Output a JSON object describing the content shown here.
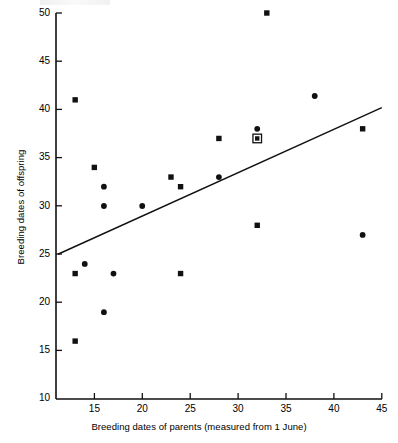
{
  "chart_data": {
    "type": "scatter",
    "title": "",
    "xlabel": "Breeding dates of parents (measured from 1 June)",
    "ylabel": "Breeding dates of offspring",
    "xlim": [
      11,
      45
    ],
    "ylim": [
      10,
      50
    ],
    "xticks": [
      15,
      20,
      25,
      30,
      35,
      40,
      45
    ],
    "yticks": [
      10,
      15,
      20,
      25,
      30,
      35,
      40,
      45,
      50
    ],
    "grid": false,
    "legend": "none",
    "series": [
      {
        "name": "square-markers",
        "marker": "square",
        "points": [
          {
            "x": 13,
            "y": 41
          },
          {
            "x": 13,
            "y": 23
          },
          {
            "x": 13,
            "y": 16
          },
          {
            "x": 15,
            "y": 34
          },
          {
            "x": 23,
            "y": 33
          },
          {
            "x": 24,
            "y": 32
          },
          {
            "x": 24,
            "y": 23
          },
          {
            "x": 28,
            "y": 37
          },
          {
            "x": 32,
            "y": 28
          },
          {
            "x": 33,
            "y": 50
          },
          {
            "x": 43,
            "y": 38
          }
        ]
      },
      {
        "name": "circle-markers",
        "marker": "circle",
        "points": [
          {
            "x": 14,
            "y": 24
          },
          {
            "x": 16,
            "y": 32
          },
          {
            "x": 16,
            "y": 30
          },
          {
            "x": 16,
            "y": 19
          },
          {
            "x": 17,
            "y": 23
          },
          {
            "x": 20,
            "y": 30
          },
          {
            "x": 28,
            "y": 33
          },
          {
            "x": 32,
            "y": 38
          },
          {
            "x": 38,
            "y": 41.4
          },
          {
            "x": 43,
            "y": 27
          }
        ]
      },
      {
        "name": "overlapping-square-circle",
        "marker": "square-with-circle",
        "points": [
          {
            "x": 32,
            "y": 37
          }
        ]
      }
    ],
    "regression_line": {
      "name": "fitted-regression-line",
      "x_start": 11.2,
      "y_start": 25.0,
      "x_end": 45.0,
      "y_end": 40.2
    }
  },
  "axis": {
    "x_tick_labels": [
      "15",
      "20",
      "25",
      "30",
      "35",
      "40",
      "45"
    ],
    "y_tick_labels": [
      "50",
      "45",
      "40",
      "35",
      "30",
      "25",
      "20",
      "15",
      "10"
    ]
  },
  "colors": {
    "ink": "#1a1a1a",
    "background": "#ffffff",
    "marker": "#111111"
  }
}
